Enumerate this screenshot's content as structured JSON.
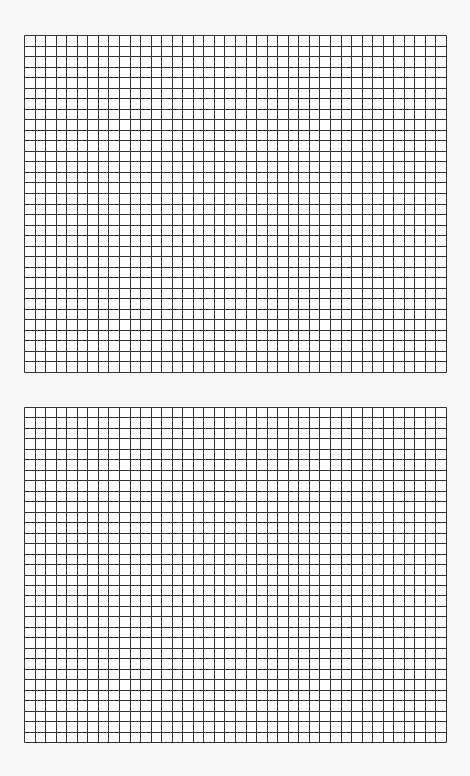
{
  "page": {
    "background": "#f7f7f7"
  },
  "grids": [
    {
      "name": "top-grid",
      "x": 24,
      "y": 35,
      "width": 422,
      "height": 337,
      "cols": 40,
      "rows": 32,
      "line_color": "#333333",
      "fill": "#ffffff"
    },
    {
      "name": "bottom-grid",
      "x": 24,
      "y": 407,
      "width": 422,
      "height": 335,
      "cols": 40,
      "rows": 32,
      "line_color": "#333333",
      "fill": "#ffffff"
    }
  ]
}
